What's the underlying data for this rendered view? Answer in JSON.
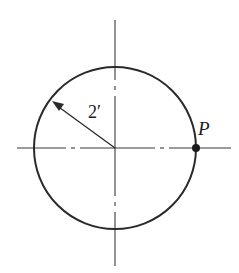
{
  "diagram": {
    "type": "circle-with-centerlines",
    "center": [
      115,
      148
    ],
    "radius_px": 81,
    "stroke_color": "#2a2a2a",
    "radius_label": "2′",
    "point_label": "P",
    "point_position": "rightmost point on circle, on horizontal centerline",
    "radius_arrow": {
      "from": "center",
      "direction": "upper-left",
      "arrowhead": "at circle"
    },
    "centerlines": [
      "horizontal dash-dot",
      "vertical dash-dot"
    ]
  }
}
